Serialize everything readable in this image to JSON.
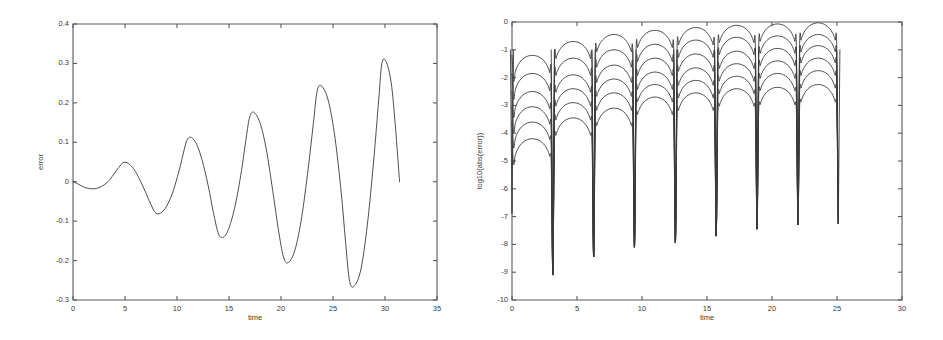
{
  "figure": {
    "background_color": "#ffffff",
    "line_color": "#3a3a3a",
    "axis_color": "#5a5a5a"
  },
  "chart_data": [
    {
      "id": "left",
      "type": "line",
      "title": "",
      "xlabel": "time",
      "ylabel": "error",
      "xlim": [
        0,
        35
      ],
      "ylim": [
        -0.3,
        0.4
      ],
      "xticks": [
        0,
        5,
        10,
        15,
        20,
        25,
        30,
        35
      ],
      "xticklabels": [
        "0",
        "5",
        "10",
        "15",
        "20",
        "25",
        "30",
        "35"
      ],
      "yticks": [
        -0.3,
        -0.2,
        -0.1,
        0,
        0.1,
        0.2,
        0.3,
        0.4
      ],
      "yticklabels": [
        "-0.3",
        "-0.2",
        "-0.1",
        "0",
        "0.1",
        "0.2",
        "0.3",
        "0.4"
      ],
      "grid": false,
      "legend": "none",
      "description": "Growing oscillatory error, envelope increases roughly linearly with time; data ends near t=31.4",
      "series": [
        {
          "name": "error",
          "color": "#3a3a3a",
          "x": [
            0.0,
            0.5,
            1.0,
            1.5,
            2.0,
            2.5,
            3.0,
            3.5,
            4.0,
            4.4,
            4.8,
            5.2,
            5.6,
            6.0,
            6.5,
            7.0,
            7.5,
            7.9,
            8.4,
            9.0,
            9.6,
            10.2,
            10.7,
            11.0,
            11.4,
            11.9,
            12.4,
            13.0,
            13.5,
            14.0,
            14.5,
            15.0,
            15.6,
            16.2,
            16.7,
            17.0,
            17.4,
            18.0,
            18.6,
            19.2,
            19.8,
            20.3,
            20.8,
            21.4,
            22.0,
            22.6,
            23.1,
            23.5,
            24.0,
            24.6,
            25.2,
            25.8,
            26.2,
            26.6,
            27.1,
            27.7,
            28.3,
            28.9,
            29.4,
            29.7,
            30.1,
            30.6,
            31.0,
            31.4
          ],
          "y": [
            0.0,
            -0.006,
            -0.013,
            -0.017,
            -0.018,
            -0.015,
            -0.008,
            0.004,
            0.022,
            0.036,
            0.048,
            0.048,
            0.04,
            0.026,
            0.001,
            -0.028,
            -0.058,
            -0.078,
            -0.08,
            -0.062,
            -0.026,
            0.028,
            0.082,
            0.108,
            0.112,
            0.094,
            0.056,
            -0.01,
            -0.078,
            -0.133,
            -0.14,
            -0.117,
            -0.06,
            0.028,
            0.12,
            0.165,
            0.176,
            0.148,
            0.08,
            -0.022,
            -0.13,
            -0.196,
            -0.203,
            -0.168,
            -0.088,
            0.03,
            0.145,
            0.233,
            0.24,
            0.2,
            0.11,
            -0.03,
            -0.15,
            -0.253,
            -0.263,
            -0.22,
            -0.11,
            0.05,
            0.21,
            0.3,
            0.305,
            0.25,
            0.14,
            0.0
          ]
        }
      ],
      "annotations": [
        {
          "text": "peak",
          "t": 4.8,
          "value": 0.048
        },
        {
          "text": "peak",
          "t": 11.0,
          "value": 0.112
        },
        {
          "text": "peak",
          "t": 17.0,
          "value": 0.176
        },
        {
          "text": "peak",
          "t": 23.5,
          "value": 0.24
        },
        {
          "text": "peak",
          "t": 29.7,
          "value": 0.305
        },
        {
          "text": "trough",
          "t": 2.0,
          "value": -0.018
        },
        {
          "text": "trough",
          "t": 7.9,
          "value": -0.08
        },
        {
          "text": "trough",
          "t": 14.0,
          "value": -0.14
        },
        {
          "text": "trough",
          "t": 20.3,
          "value": -0.203
        },
        {
          "text": "trough",
          "t": 26.6,
          "value": -0.263
        }
      ]
    },
    {
      "id": "right",
      "type": "line",
      "title": "",
      "xlabel": "time",
      "ylabel": "log10(abs(error))",
      "xlim": [
        0,
        30
      ],
      "ylim": [
        -10,
        0
      ],
      "xticks": [
        0,
        5,
        10,
        15,
        20,
        25,
        30
      ],
      "xticklabels": [
        "0",
        "5",
        "10",
        "15",
        "20",
        "25",
        "30"
      ],
      "yticks": [
        -10,
        -9,
        -8,
        -7,
        -6,
        -5,
        -4,
        -3,
        -2,
        -1,
        0
      ],
      "yticklabels": [
        "-10",
        "-9",
        "-8",
        "-7",
        "-6",
        "-5",
        "-4",
        "-3",
        "-2",
        "-1",
        "0"
      ],
      "grid": false,
      "legend": "none",
      "description": "Six nested log-error curves, each with sharp downward cusps at multiples of pi; arches grow toward 0 with time. Data ends near t=25.1",
      "cusp_times": [
        0.0,
        3.14,
        6.28,
        9.42,
        12.57,
        15.71,
        18.85,
        22.0,
        25.1
      ],
      "cusp_depths": [
        -6.9,
        -9.1,
        -8.45,
        -8.1,
        -7.95,
        -7.7,
        -7.45,
        -7.3,
        -7.25
      ],
      "series": [
        {
          "name": "curve-1",
          "color": "#3a3a3a",
          "offset0": -4.2,
          "growth": 0.105,
          "cap": -0.05,
          "peak_values": [
            -4.2,
            -3.45,
            -3.1,
            -2.7,
            -2.55,
            -2.4,
            -2.35,
            -2.25
          ]
        },
        {
          "name": "curve-2",
          "color": "#3a3a3a",
          "offset0": -3.6,
          "growth": 0.11,
          "cap": -0.05,
          "peak_values": [
            -3.6,
            -2.9,
            -2.55,
            -2.25,
            -2.1,
            -1.95,
            -1.85,
            -1.75
          ]
        },
        {
          "name": "curve-3",
          "color": "#3a3a3a",
          "offset0": -3.05,
          "growth": 0.112,
          "cap": -0.05,
          "peak_values": [
            -3.05,
            -2.4,
            -2.05,
            -1.8,
            -1.65,
            -1.5,
            -1.4,
            -1.3
          ]
        },
        {
          "name": "curve-4",
          "color": "#3a3a3a",
          "offset0": -2.5,
          "growth": 0.115,
          "cap": -0.05,
          "peak_values": [
            -2.5,
            -1.9,
            -1.55,
            -1.3,
            -1.15,
            -1.05,
            -0.95,
            -0.85
          ]
        },
        {
          "name": "curve-5",
          "color": "#3a3a3a",
          "offset0": -1.85,
          "growth": 0.118,
          "cap": -0.05,
          "peak_values": [
            -1.85,
            -1.3,
            -1.0,
            -0.8,
            -0.65,
            -0.55,
            -0.5,
            -0.45
          ]
        },
        {
          "name": "curve-6",
          "color": "#3a3a3a",
          "offset0": -1.2,
          "growth": 0.12,
          "cap": -0.02,
          "peak_values": [
            -1.2,
            -0.7,
            -0.45,
            -0.3,
            -0.2,
            -0.12,
            -0.07,
            -0.03
          ]
        }
      ]
    }
  ]
}
